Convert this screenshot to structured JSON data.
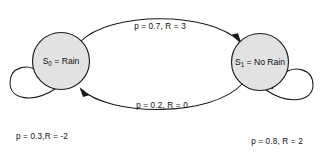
{
  "diagram": {
    "type": "markov-decision-process-state-diagram",
    "background_color": "#ffffff",
    "node_fill_color": "#e2e2e2",
    "stroke_color": "#1a1a1a",
    "nodes": [
      {
        "id": "S0",
        "state_symbol": "S",
        "state_subscript": "0",
        "equals": " = ",
        "state_name": "Rain",
        "full_label": "S0 = Rain",
        "cx": 61,
        "cy": 61,
        "r": 28.5
      },
      {
        "id": "S1",
        "state_symbol": "S",
        "state_subscript": "1",
        "equals": " = ",
        "state_name": "No Rain",
        "full_label": "S1 = No Rain",
        "cx": 260,
        "cy": 62,
        "r": 28.5
      }
    ],
    "transitions": [
      {
        "id": "s0-to-s1",
        "from": "S0",
        "to": "S1",
        "probability": "0.7",
        "reward": "3",
        "label": "p = 0.7, R = 3",
        "label_x": 160,
        "label_y": 27
      },
      {
        "id": "s1-to-s0",
        "from": "S1",
        "to": "S0",
        "probability": "0.2",
        "reward": "0",
        "label": "p = 0.2, R = 0",
        "label_x": 162,
        "label_y": 106
      },
      {
        "id": "s0-self-loop",
        "from": "S0",
        "to": "S0",
        "probability": "0.3",
        "reward": "-2",
        "label": "p = 0.3,R = -2",
        "label_x": 42,
        "label_y": 137
      },
      {
        "id": "s1-self-loop",
        "from": "S1",
        "to": "S1",
        "probability": "0.8",
        "reward": "2",
        "label": "p = 0.8, R = 2",
        "label_x": 277,
        "label_y": 142
      }
    ]
  }
}
